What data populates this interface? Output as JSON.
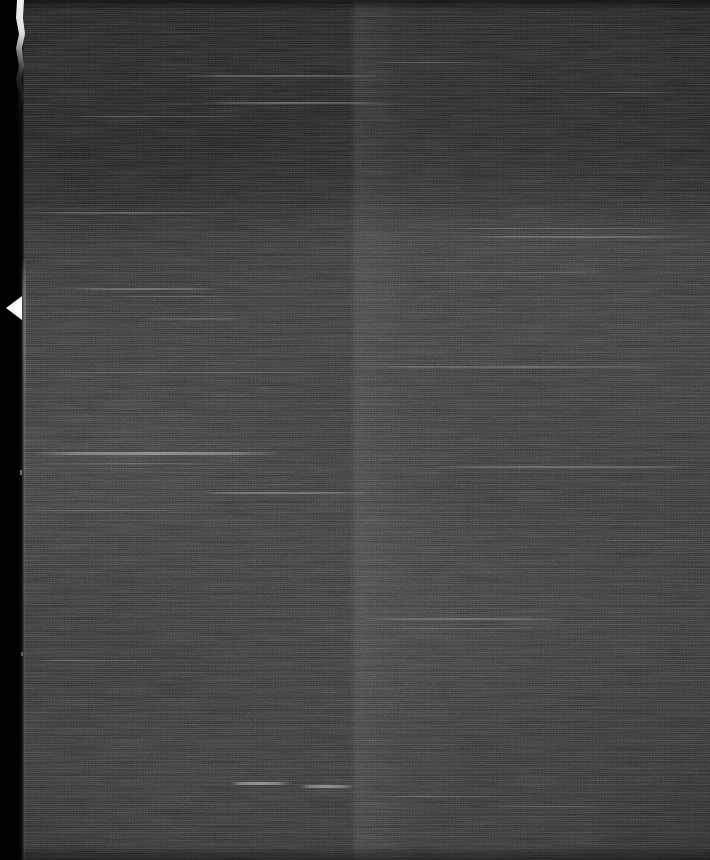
{
  "image": {
    "kind": "scanned-film-frame",
    "description": "Dark, heavily grained monochrome film/microfilm scan with horizontal scanline streaking",
    "width": 710,
    "height": 860,
    "orientation": "portrait",
    "alt_text": "Very dark grainy scanned film frame with horizontal streaks, a black left margin and a ragged bright film edge"
  },
  "palette": {
    "background": "#2e2e2e",
    "darkest": "#0a0a0a",
    "upper_band": "#1e1e1e",
    "mid_band": "#313131",
    "lower_band": "#2c2c2c",
    "border_black": "#000000",
    "edge_white": "#f2f2f2",
    "streak_highlight": "#bdbdbd"
  },
  "regions": [
    {
      "name": "left-black-margin",
      "x": 0,
      "y": 0,
      "width": 24,
      "height": 860,
      "tone": "#000000"
    },
    {
      "name": "ragged-film-edge",
      "x": 12,
      "y": 0,
      "width": 14,
      "height": 330,
      "tone": "#f2f2f2"
    },
    {
      "name": "edge-notch",
      "x": 6,
      "y": 296,
      "width": 18,
      "height": 24,
      "tone": "#ffffff"
    },
    {
      "name": "upper-dark-band",
      "x": 24,
      "y": 0,
      "width": 686,
      "height": 205,
      "tone": "#1e1e1e"
    },
    {
      "name": "main-field",
      "x": 24,
      "y": 205,
      "width": 686,
      "height": 655,
      "tone": "#303030"
    },
    {
      "name": "vertical-splice-seam",
      "x": 352,
      "y": 0,
      "width": 8,
      "height": 860,
      "tone": "#262626"
    }
  ],
  "streaks": [
    {
      "x": 180,
      "y": 75,
      "width": 200,
      "height": 2,
      "opacity": 0.22
    },
    {
      "x": 200,
      "y": 102,
      "width": 190,
      "height": 2,
      "opacity": 0.26
    },
    {
      "x": 60,
      "y": 116,
      "width": 180,
      "height": 1,
      "opacity": 0.2
    },
    {
      "x": 370,
      "y": 62,
      "width": 120,
      "height": 1,
      "opacity": 0.16
    },
    {
      "x": 24,
      "y": 212,
      "width": 200,
      "height": 2,
      "opacity": 0.18
    },
    {
      "x": 430,
      "y": 228,
      "width": 260,
      "height": 1,
      "opacity": 0.22
    },
    {
      "x": 455,
      "y": 236,
      "width": 240,
      "height": 2,
      "opacity": 0.2
    },
    {
      "x": 70,
      "y": 288,
      "width": 150,
      "height": 2,
      "opacity": 0.24
    },
    {
      "x": 110,
      "y": 296,
      "width": 130,
      "height": 1,
      "opacity": 0.18
    },
    {
      "x": 420,
      "y": 272,
      "width": 180,
      "height": 1,
      "opacity": 0.14
    },
    {
      "x": 140,
      "y": 318,
      "width": 110,
      "height": 2,
      "opacity": 0.16
    },
    {
      "x": 24,
      "y": 372,
      "width": 330,
      "height": 1,
      "opacity": 0.2
    },
    {
      "x": 360,
      "y": 366,
      "width": 300,
      "height": 2,
      "opacity": 0.18
    },
    {
      "x": 30,
      "y": 452,
      "width": 250,
      "height": 3,
      "opacity": 0.38
    },
    {
      "x": 30,
      "y": 463,
      "width": 200,
      "height": 1,
      "opacity": 0.2
    },
    {
      "x": 430,
      "y": 466,
      "width": 270,
      "height": 2,
      "opacity": 0.22
    },
    {
      "x": 200,
      "y": 492,
      "width": 170,
      "height": 2,
      "opacity": 0.26
    },
    {
      "x": 24,
      "y": 510,
      "width": 160,
      "height": 1,
      "opacity": 0.16
    },
    {
      "x": 360,
      "y": 618,
      "width": 210,
      "height": 2,
      "opacity": 0.24
    },
    {
      "x": 380,
      "y": 628,
      "width": 160,
      "height": 1,
      "opacity": 0.16
    },
    {
      "x": 24,
      "y": 660,
      "width": 140,
      "height": 1,
      "opacity": 0.14
    },
    {
      "x": 230,
      "y": 782,
      "width": 60,
      "height": 3,
      "opacity": 0.42
    },
    {
      "x": 300,
      "y": 785,
      "width": 55,
      "height": 3,
      "opacity": 0.4
    },
    {
      "x": 370,
      "y": 796,
      "width": 130,
      "height": 1,
      "opacity": 0.18
    },
    {
      "x": 480,
      "y": 806,
      "width": 120,
      "height": 1,
      "opacity": 0.14
    },
    {
      "x": 560,
      "y": 92,
      "width": 120,
      "height": 1,
      "opacity": 0.14
    },
    {
      "x": 600,
      "y": 540,
      "width": 100,
      "height": 1,
      "opacity": 0.14
    }
  ]
}
